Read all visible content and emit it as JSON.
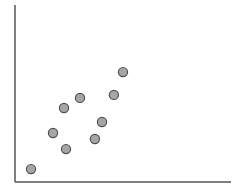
{
  "chart_data": {
    "type": "scatter",
    "title": "",
    "xlabel": "",
    "ylabel": "",
    "xlim": [
      0,
      10
    ],
    "ylim": [
      0,
      10
    ],
    "grid": false,
    "legend": null,
    "series": [
      {
        "name": "points",
        "color": "#a6a6a6",
        "edgecolor": "#505050",
        "x": [
          0.74,
          1.76,
          2.36,
          2.27,
          3.01,
          3.7,
          4.03,
          4.58,
          5.0
        ],
        "y": [
          0.73,
          2.77,
          1.86,
          4.18,
          4.75,
          2.43,
          3.39,
          4.92,
          6.21
        ]
      }
    ]
  },
  "layout": {
    "plot_left": 15,
    "plot_right": 231,
    "plot_top": 5,
    "plot_bottom": 182,
    "dot_radius": 4.6
  }
}
